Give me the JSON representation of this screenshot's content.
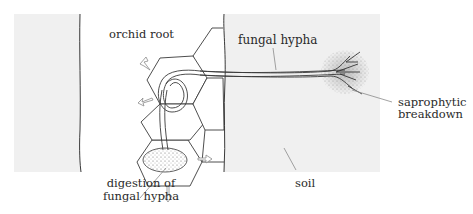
{
  "diagram": {
    "labels": {
      "orchid_root": "orchid root",
      "fungal_hypha": "fungal hypha",
      "saprophytic_line1": "saprophytic",
      "saprophytic_line2": "breakdown",
      "digestion_line1": "digestion of",
      "digestion_line2": "fungal hypha",
      "soil": "soil"
    },
    "regions": [
      "left tissue",
      "orchid root",
      "soil"
    ],
    "colors": {
      "background": "#ffffff",
      "tissue_fill": "#f0f0f0",
      "line": "#3a3a3a",
      "leader_line": "#8a8a8a",
      "stipple": "#555555"
    }
  }
}
